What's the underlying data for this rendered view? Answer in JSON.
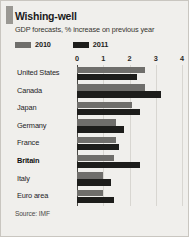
{
  "card": {
    "title": "Wishing-well",
    "subtitle": "GDP forecasts, % increase on previous year",
    "source": "Source: IMF"
  },
  "legend": [
    {
      "label": "2010",
      "color": "#6f6e6b"
    },
    {
      "label": "2011",
      "color": "#1d1d1b"
    }
  ],
  "colors": {
    "series_2010": "#6f6e6b",
    "series_2011": "#1d1d1b",
    "background": "#f0efec",
    "border": "#c9c6c0",
    "gridline": "#d8d6d1",
    "axis": "#4a4945"
  },
  "axis": {
    "ticks": [
      "0",
      "1",
      "2",
      "3",
      "4"
    ],
    "min": 0,
    "max": 4
  },
  "highlight_category": "Britain",
  "chart_data": {
    "type": "bar",
    "orientation": "horizontal",
    "title": "Wishing-well",
    "subtitle": "GDP forecasts, % increase on previous year",
    "xlabel": "% increase on previous year",
    "ylabel": "",
    "xlim": [
      0,
      4
    ],
    "grid": true,
    "legend_position": "top-left",
    "source": "Source: IMF",
    "categories": [
      "United States",
      "Canada",
      "Japan",
      "Germany",
      "France",
      "Britain",
      "Italy",
      "Euro area"
    ],
    "series": [
      {
        "name": "2010",
        "color": "#6f6e6b",
        "values": [
          2.6,
          2.6,
          2.1,
          1.5,
          1.5,
          1.4,
          1.0,
          1.0
        ]
      },
      {
        "name": "2011",
        "color": "#1d1d1b",
        "values": [
          2.3,
          3.2,
          2.4,
          1.8,
          1.6,
          2.4,
          1.3,
          1.4
        ]
      }
    ]
  }
}
